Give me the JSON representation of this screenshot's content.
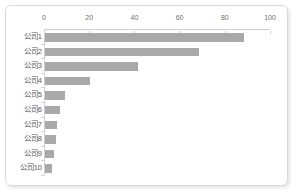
{
  "card": {
    "background_color": "#ffffff",
    "border_color": "#d9d9d9"
  },
  "chart_data": {
    "type": "bar",
    "orientation": "horizontal",
    "title": "",
    "subtitle": "",
    "xlabel": "",
    "ylabel": "",
    "categories": [
      "公司1",
      "公司2",
      "公司3",
      "公司4",
      "公司5",
      "公司6",
      "公司7",
      "公司8",
      "公司9",
      "公司10"
    ],
    "values": [
      88,
      68,
      41,
      20,
      9,
      6.5,
      5.5,
      5,
      3.8,
      3.2
    ],
    "xlim": [
      0,
      100
    ],
    "xticks": [
      0,
      20,
      40,
      60,
      80,
      100
    ],
    "xtick_labels": [
      "0",
      "20",
      "40",
      "60",
      "80",
      "100"
    ],
    "x_axis_position": "top",
    "grid": false,
    "legend": false,
    "bar_color": "#a9a9a9",
    "axis_color": "#cfcfcf",
    "tick_label_color": "#6e6e6e",
    "category_label_color": "#5a5a5a"
  }
}
